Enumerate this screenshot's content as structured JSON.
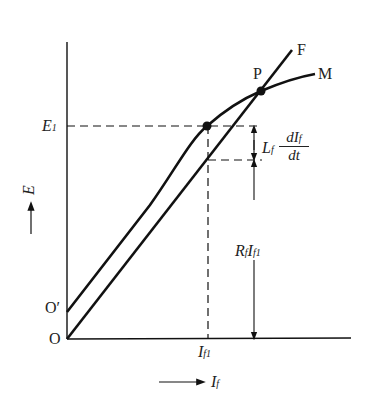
{
  "diagram": {
    "type": "magnetization curve and field resistance line",
    "curves": [
      {
        "name": "M",
        "label": "M",
        "description": "magnetization curve starting at O'"
      },
      {
        "name": "F",
        "label": "F",
        "description": "field resistance line starting at O"
      }
    ],
    "points": {
      "intersection": "P",
      "operating_point_E": "E",
      "E1_label": "E",
      "E1_sub": "1",
      "origin": "O",
      "origin_prime": "O′"
    },
    "x_axis": {
      "label": "I",
      "label_sub": "f",
      "arrow": "→"
    },
    "y_axis": {
      "label": "E",
      "arrow": "→"
    },
    "x_tick": {
      "label": "I",
      "sub1": "f",
      "sub2": "1"
    },
    "annotations": {
      "inductive": {
        "coef": "L",
        "coef_sub": "f",
        "num": "dI",
        "num_sub": "f",
        "den": "dt"
      },
      "resistive": {
        "r": "R",
        "r_sub": "f",
        "i": "I",
        "i_sub": "f",
        "i_sub2": "1"
      }
    }
  }
}
